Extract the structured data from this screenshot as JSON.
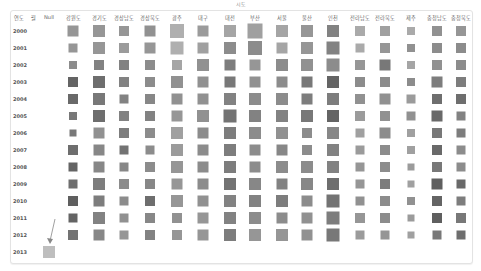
{
  "chart_data": {
    "type": "heatmap",
    "title": "시도",
    "row_header_labels": [
      "연도",
      "월",
      "Null"
    ],
    "columns": [
      "강원도",
      "경기도",
      "경상남도",
      "경상북도",
      "광주",
      "대구",
      "대전",
      "부산",
      "서울",
      "울산",
      "인천",
      "전라남도",
      "전라북도",
      "제주",
      "충청남도",
      "충청북도"
    ],
    "rows": [
      "2000",
      "2001",
      "2002",
      "2003",
      "2004",
      "2005",
      "2006",
      "2007",
      "2008",
      "2009",
      "2010",
      "2011",
      "2012",
      "2013"
    ],
    "encoding": "square size and gray darkness (larger/darker = higher value)",
    "size_px": [
      [
        11,
        12,
        10,
        11,
        14,
        11,
        12,
        15,
        12,
        12,
        12,
        10,
        10,
        8,
        10,
        10
      ],
      [
        9,
        12,
        10,
        11,
        13,
        11,
        12,
        14,
        11,
        12,
        13,
        9,
        10,
        8,
        10,
        10
      ],
      [
        8,
        10,
        10,
        10,
        10,
        12,
        11,
        11,
        12,
        12,
        13,
        10,
        11,
        8,
        10,
        10
      ],
      [
        10,
        12,
        10,
        10,
        12,
        11,
        11,
        11,
        11,
        11,
        12,
        10,
        10,
        8,
        11,
        10
      ],
      [
        10,
        12,
        9,
        10,
        11,
        11,
        12,
        12,
        12,
        11,
        12,
        10,
        11,
        9,
        10,
        10
      ],
      [
        8,
        12,
        10,
        10,
        11,
        12,
        13,
        12,
        12,
        12,
        12,
        10,
        10,
        9,
        11,
        9
      ],
      [
        7,
        11,
        10,
        10,
        12,
        11,
        12,
        12,
        12,
        10,
        12,
        9,
        11,
        8,
        10,
        9
      ],
      [
        10,
        11,
        9,
        9,
        12,
        11,
        12,
        11,
        11,
        10,
        12,
        9,
        10,
        8,
        10,
        9
      ],
      [
        9,
        11,
        9,
        10,
        12,
        11,
        12,
        11,
        12,
        12,
        12,
        9,
        10,
        7,
        10,
        9
      ],
      [
        9,
        12,
        10,
        10,
        11,
        11,
        12,
        12,
        11,
        12,
        12,
        9,
        10,
        7,
        11,
        9
      ],
      [
        10,
        11,
        9,
        10,
        12,
        11,
        12,
        12,
        12,
        11,
        13,
        9,
        10,
        8,
        10,
        9
      ],
      [
        9,
        12,
        9,
        10,
        10,
        11,
        12,
        12,
        11,
        11,
        13,
        10,
        10,
        7,
        10,
        10
      ],
      [
        10,
        11,
        9,
        10,
        10,
        11,
        12,
        12,
        12,
        11,
        13,
        9,
        9,
        7,
        9,
        9
      ],
      []
    ],
    "gray_level": [
      [
        150,
        150,
        150,
        145,
        175,
        155,
        165,
        160,
        165,
        150,
        130,
        170,
        160,
        170,
        145,
        150
      ],
      [
        150,
        150,
        155,
        150,
        175,
        160,
        140,
        140,
        165,
        150,
        130,
        170,
        150,
        145,
        140,
        140
      ],
      [
        140,
        130,
        130,
        140,
        165,
        145,
        125,
        150,
        140,
        145,
        140,
        150,
        120,
        165,
        145,
        140
      ],
      [
        100,
        110,
        130,
        140,
        145,
        145,
        120,
        145,
        140,
        120,
        100,
        140,
        140,
        140,
        125,
        125
      ],
      [
        105,
        120,
        130,
        135,
        145,
        145,
        130,
        140,
        140,
        125,
        125,
        145,
        145,
        155,
        110,
        110
      ],
      [
        120,
        110,
        130,
        130,
        150,
        145,
        115,
        130,
        130,
        120,
        100,
        155,
        145,
        145,
        105,
        130
      ],
      [
        120,
        145,
        125,
        140,
        160,
        140,
        125,
        140,
        145,
        140,
        135,
        160,
        140,
        160,
        120,
        125
      ],
      [
        110,
        135,
        115,
        140,
        155,
        140,
        125,
        140,
        135,
        140,
        130,
        155,
        140,
        160,
        105,
        140
      ],
      [
        100,
        135,
        135,
        140,
        150,
        140,
        125,
        140,
        140,
        140,
        130,
        150,
        140,
        155,
        120,
        140
      ],
      [
        110,
        125,
        140,
        135,
        150,
        140,
        115,
        135,
        130,
        135,
        110,
        150,
        125,
        160,
        95,
        105
      ],
      [
        95,
        125,
        140,
        110,
        150,
        145,
        130,
        130,
        125,
        140,
        115,
        145,
        140,
        145,
        100,
        125
      ],
      [
        100,
        130,
        145,
        135,
        145,
        150,
        130,
        140,
        140,
        145,
        125,
        150,
        140,
        155,
        95,
        120
      ],
      [
        115,
        135,
        150,
        130,
        150,
        150,
        125,
        150,
        150,
        145,
        120,
        155,
        150,
        160,
        120,
        110
      ],
      []
    ],
    "null_column": {
      "row": "2013",
      "size_px": 12,
      "gray_level": 190
    },
    "annotation": "arrow pointing to 2013 Null cell"
  }
}
